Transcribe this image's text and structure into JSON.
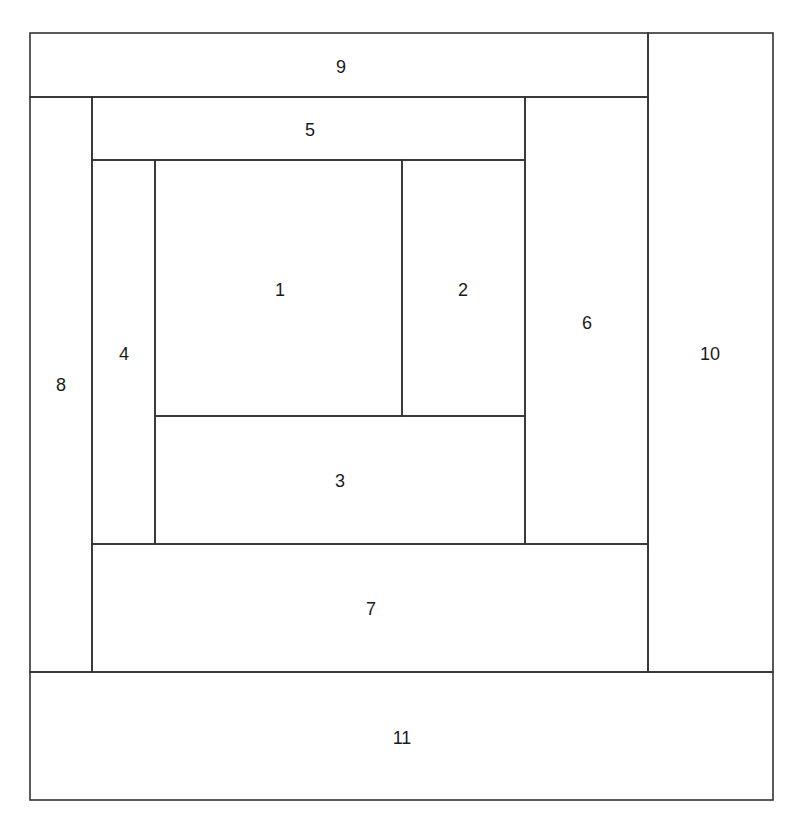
{
  "diagram": {
    "line_color": "#333333",
    "background": "#ffffff",
    "blocks": [
      {
        "label": "1",
        "x": 155,
        "y": 160,
        "w": 247,
        "h": 256,
        "lx": 280,
        "ly": 290
      },
      {
        "label": "2",
        "x": 402,
        "y": 160,
        "w": 123,
        "h": 256,
        "lx": 463,
        "ly": 290
      },
      {
        "label": "3",
        "x": 155,
        "y": 416,
        "w": 370,
        "h": 128,
        "lx": 340,
        "ly": 481
      },
      {
        "label": "4",
        "x": 92,
        "y": 160,
        "w": 63,
        "h": 384,
        "lx": 124,
        "ly": 354
      },
      {
        "label": "5",
        "x": 92,
        "y": 97,
        "w": 433,
        "h": 63,
        "lx": 310,
        "ly": 130
      },
      {
        "label": "6",
        "x": 525,
        "y": 97,
        "w": 123,
        "h": 447,
        "lx": 587,
        "ly": 323
      },
      {
        "label": "7",
        "x": 92,
        "y": 544,
        "w": 556,
        "h": 128,
        "lx": 371,
        "ly": 609
      },
      {
        "label": "8",
        "x": 30,
        "y": 97,
        "w": 62,
        "h": 575,
        "lx": 61,
        "ly": 385
      },
      {
        "label": "9",
        "x": 30,
        "y": 33,
        "w": 618,
        "h": 64,
        "lx": 341,
        "ly": 67
      },
      {
        "label": "10",
        "x": 648,
        "y": 33,
        "w": 125,
        "h": 639,
        "lx": 710,
        "ly": 354
      },
      {
        "label": "11",
        "x": 30,
        "y": 672,
        "w": 743,
        "h": 128,
        "lx": 402,
        "ly": 738
      }
    ]
  }
}
